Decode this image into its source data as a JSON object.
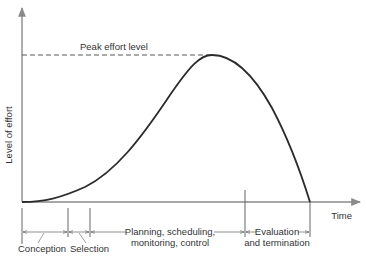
{
  "diagram": {
    "y_axis_label": "Level of effort",
    "x_axis_label": "Time",
    "peak_label": "Peak effort level",
    "phases": [
      {
        "id": "conception",
        "label_lines": [
          "Conception"
        ]
      },
      {
        "id": "selection",
        "label_lines": [
          "Selection"
        ]
      },
      {
        "id": "planning",
        "label_lines": [
          "Planning, scheduling,",
          "monitoring, control"
        ]
      },
      {
        "id": "evaluation",
        "label_lines": [
          "Evaluation",
          "and termination"
        ]
      }
    ]
  },
  "colors": {
    "curve": "#2b2b2b",
    "axis": "#8a8a8a",
    "text": "#333333"
  }
}
